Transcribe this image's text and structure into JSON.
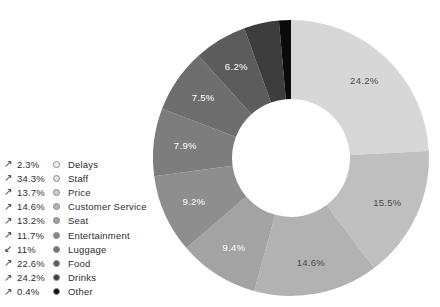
{
  "chart_title": "Reasons for Complaints",
  "chart_data": {
    "type": "pie",
    "variant": "donut",
    "xlabel": "",
    "ylabel": "",
    "start_angle_deg": 0,
    "direction": "clockwise",
    "inner_radius_ratio": 0.43,
    "legend_position": "left",
    "grid": false,
    "categories": [
      "Delays",
      "Staff",
      "Price",
      "Customer Service",
      "Seat",
      "Entertainment",
      "Luggage",
      "Food",
      "Drinks",
      "Other"
    ],
    "values": [
      24.2,
      15.5,
      14.6,
      9.4,
      9.2,
      7.9,
      7.5,
      6.2,
      4.1,
      1.4
    ],
    "slice_labels": [
      "24.2%",
      "15.5%",
      "14.6%",
      "9.4%",
      "9.2%",
      "7.9%",
      "7.5%",
      "6.2%",
      "",
      ""
    ],
    "colors": [
      "#d7d7d7",
      "#bfbfbf",
      "#b2b2b2",
      "#a3a3a3",
      "#8e8e8e",
      "#7d7d7d",
      "#6e6e6e",
      "#5c5c5c",
      "#3d3d3d",
      "#0a0a0a"
    ],
    "slice_label_colors": [
      "#4a4a4a",
      "#4a4a4a",
      "#4a4a4a",
      "#ffffff",
      "#ffffff",
      "#ffffff",
      "#ffffff",
      "#ffffff",
      "#ffffff",
      "#ffffff"
    ]
  },
  "legend": {
    "rows": [
      {
        "arrow": "up-right",
        "glyph": "↗",
        "percent": "2.3%",
        "label": "Delays",
        "color": "#f2f2f2"
      },
      {
        "arrow": "up-right",
        "glyph": "↗",
        "percent": "34.3%",
        "label": "Staff",
        "color": "#e2e2e2"
      },
      {
        "arrow": "up-right",
        "glyph": "↗",
        "percent": "13.7%",
        "label": "Price",
        "color": "#cccccc"
      },
      {
        "arrow": "up-right",
        "glyph": "↗",
        "percent": "14.6%",
        "label": "Customer Service",
        "color": "#b4b4b4"
      },
      {
        "arrow": "up-right",
        "glyph": "↗",
        "percent": "13.2%",
        "label": "Seat",
        "color": "#9e9e9e"
      },
      {
        "arrow": "up-right",
        "glyph": "↗",
        "percent": "11.7%",
        "label": "Entertainment",
        "color": "#8a8a8a"
      },
      {
        "arrow": "down-left",
        "glyph": "↙",
        "percent": "11%",
        "label": "Luggage",
        "color": "#757575"
      },
      {
        "arrow": "up-right",
        "glyph": "↗",
        "percent": "22.6%",
        "label": "Food",
        "color": "#5e5e5e"
      },
      {
        "arrow": "up-right",
        "glyph": "↗",
        "percent": "24.2%",
        "label": "Drinks",
        "color": "#404040"
      },
      {
        "arrow": "up-right",
        "glyph": "↗",
        "percent": "0.4%",
        "label": "Other",
        "color": "#111111"
      }
    ]
  }
}
